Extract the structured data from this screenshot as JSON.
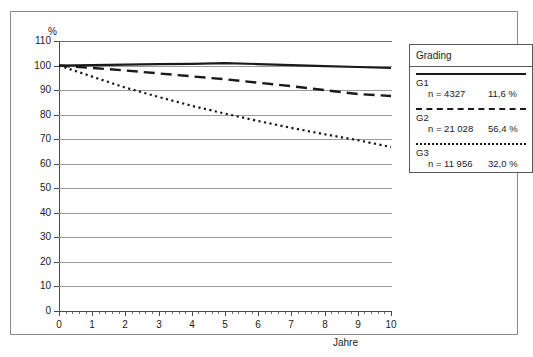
{
  "chart_data": {
    "type": "line",
    "title": "",
    "xlabel": "Jahre",
    "ylabel": "%",
    "xlim": [
      0,
      10
    ],
    "ylim": [
      0,
      110
    ],
    "xticks": [
      "0",
      "1",
      "2",
      "3",
      "4",
      "5",
      "6",
      "7",
      "8",
      "9",
      "10"
    ],
    "yticks": [
      "0",
      "10",
      "20",
      "30",
      "40",
      "50",
      "60",
      "70",
      "80",
      "90",
      "100",
      "110"
    ],
    "grid": "horizontal",
    "legend_position": "right",
    "x": [
      0,
      1,
      2,
      3,
      4,
      5,
      6,
      7,
      8,
      9,
      10
    ],
    "series": [
      {
        "name": "G1",
        "style": "solid",
        "color": "#1a1a1a",
        "n_label": "n = 4327",
        "percent_label": "11,6 %",
        "values": [
          100,
          100.2,
          100.4,
          100.6,
          100.7,
          101,
          100.6,
          100.2,
          99.8,
          99.4,
          99
        ]
      },
      {
        "name": "G2",
        "style": "dashed",
        "color": "#1a1a1a",
        "n_label": "n = 21 028",
        "percent_label": "56,4 %",
        "values": [
          100,
          99,
          98,
          96.8,
          95.6,
          94.4,
          93,
          91.6,
          90,
          88.4,
          87.6
        ]
      },
      {
        "name": "G3",
        "style": "dotted",
        "color": "#1a1a1a",
        "n_label": "n = 11 956",
        "percent_label": "32,0 %",
        "values": [
          100,
          95.5,
          91,
          87.2,
          83.6,
          80.4,
          77.4,
          74.6,
          72,
          69.6,
          66.8
        ]
      }
    ]
  },
  "legend": {
    "title": "Grading"
  },
  "axes": {
    "y_unit": "%",
    "x_title": "Jahre"
  },
  "caption": {
    "text": ""
  }
}
